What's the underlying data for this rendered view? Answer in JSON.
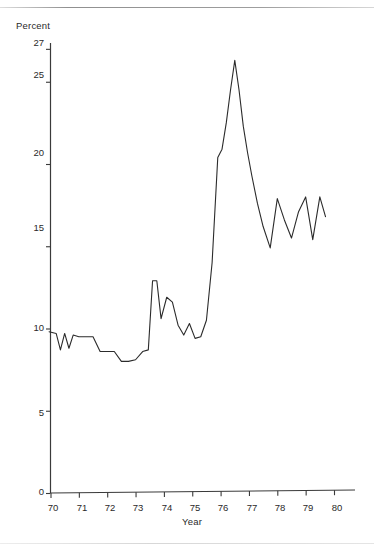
{
  "figure": {
    "title": "",
    "axis_color": "#3a3a3a",
    "line_color": "#2b2b2b",
    "background": "#ffffff"
  },
  "axes": {
    "y_axis_title": "Percent",
    "x_axis_title": "Year",
    "y_ticks": [
      "0",
      "5",
      "10",
      "15",
      "20",
      "25",
      "27"
    ],
    "x_ticks": [
      "70",
      "71",
      "72",
      "73",
      "74",
      "75",
      "76",
      "77",
      "78",
      "79",
      "80"
    ]
  },
  "chart_data": {
    "type": "line",
    "title": "",
    "subtitle": "",
    "xlabel": "Year",
    "ylabel": "Percent",
    "xlim": [
      69.85,
      80.6
    ],
    "ylim": [
      0,
      27
    ],
    "grid": false,
    "legend": "none",
    "xtick_values": [
      70,
      71,
      72,
      73,
      74,
      75,
      76,
      77,
      78,
      79,
      80
    ],
    "xtick_labels": [
      "70",
      "71",
      "72",
      "73",
      "74",
      "75",
      "76",
      "77",
      "78",
      "79",
      "80"
    ],
    "ytick_values": [
      0,
      5,
      10,
      15,
      20,
      25,
      27
    ],
    "ytick_labels": [
      "0",
      "5",
      "10",
      "15",
      "20",
      "25",
      "27"
    ],
    "series": [
      {
        "name": "Percent",
        "x": [
          69.95,
          70.2,
          70.35,
          70.5,
          70.65,
          70.8,
          71.0,
          71.25,
          71.5,
          71.75,
          72.0,
          72.25,
          72.5,
          72.75,
          73.0,
          73.25,
          73.45,
          73.6,
          73.75,
          73.9,
          74.1,
          74.3,
          74.5,
          74.7,
          74.9,
          75.1,
          75.3,
          75.5,
          75.7,
          75.9,
          76.05,
          76.2,
          76.35,
          76.5,
          76.65,
          76.8,
          76.95,
          77.1,
          77.3,
          77.5,
          77.75,
          78.0,
          78.25,
          78.5,
          78.75,
          79.0,
          79.25,
          79.5,
          79.7
        ],
        "y": [
          9.8,
          9.7,
          8.7,
          9.7,
          8.8,
          9.6,
          9.5,
          9.5,
          9.5,
          8.6,
          8.6,
          8.6,
          8.0,
          8.0,
          8.1,
          8.6,
          8.7,
          12.9,
          12.9,
          10.6,
          11.9,
          11.6,
          10.2,
          9.6,
          10.3,
          9.4,
          9.5,
          10.5,
          14.0,
          20.4,
          20.9,
          22.5,
          24.5,
          26.3,
          24.5,
          22.3,
          20.7,
          19.3,
          17.6,
          16.2,
          14.9,
          17.9,
          16.6,
          15.5,
          17.1,
          18.0,
          15.4,
          18.0,
          16.8
        ]
      }
    ]
  }
}
